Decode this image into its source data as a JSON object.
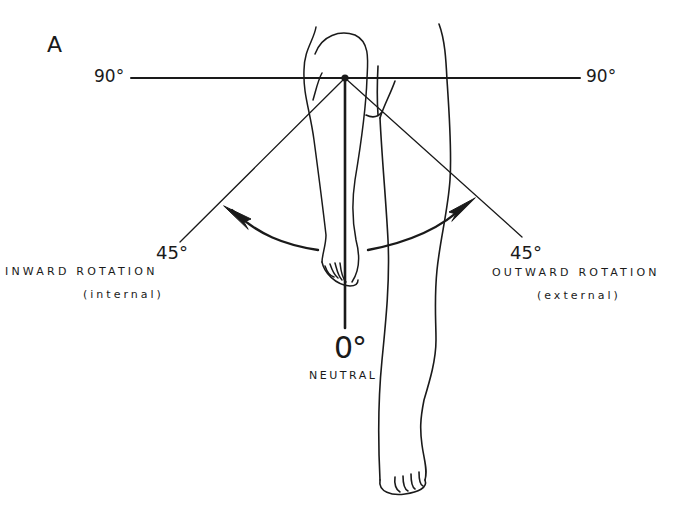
{
  "figure": {
    "panel_label": "A",
    "horizontal_axis": {
      "left_label": "90°",
      "right_label": "90°"
    },
    "inward": {
      "angle_label": "45°",
      "caption": "INWARD ROTATION",
      "subcaption": "(internal)"
    },
    "outward": {
      "angle_label": "45°",
      "caption": "OUTWARD ROTATION",
      "subcaption": "(external)"
    },
    "neutral": {
      "angle_label": "0°",
      "caption": "NEUTRAL"
    },
    "colors": {
      "ink": "#1a1a1a",
      "background": "#ffffff"
    }
  }
}
